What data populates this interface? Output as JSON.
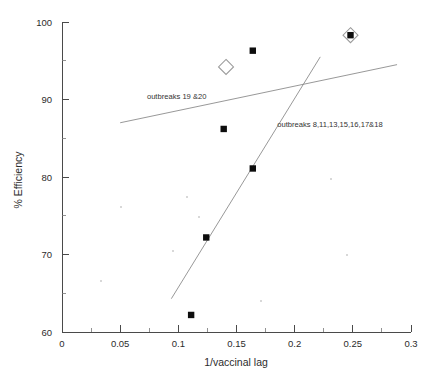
{
  "chart_data": {
    "type": "scatter",
    "title": "",
    "xlabel": "1/vaccinal lag",
    "ylabel": "% Efficiency",
    "xlim": [
      0,
      0.3
    ],
    "ylim": [
      60,
      100
    ],
    "grid": false,
    "legend_position": "inline-annotations",
    "x_ticks": [
      "0",
      "0.05",
      "0.1",
      "0.15",
      "0.2",
      "0.25",
      "0.3"
    ],
    "x_tick_values": [
      0,
      0.05,
      0.1,
      0.15,
      0.2,
      0.25,
      0.3
    ],
    "x_minor_tick_values": [
      0.025,
      0.075,
      0.125,
      0.175,
      0.225,
      0.275
    ],
    "y_ticks": [
      "60",
      "70",
      "80",
      "90",
      "100"
    ],
    "y_tick_values": [
      60,
      70,
      80,
      90,
      100
    ],
    "y_minor_tick_values": [
      65,
      75,
      85,
      95
    ],
    "series": [
      {
        "name": "data-points-filled-square",
        "marker": "filled-square",
        "points": [
          {
            "x": 0.111,
            "y": 62.2
          },
          {
            "x": 0.124,
            "y": 72.2
          },
          {
            "x": 0.139,
            "y": 86.2
          },
          {
            "x": 0.164,
            "y": 81.1
          },
          {
            "x": 0.164,
            "y": 96.3
          },
          {
            "x": 0.248,
            "y": 98.3
          }
        ]
      },
      {
        "name": "data-points-open-diamond",
        "marker": "open-diamond",
        "points": [
          {
            "x": 0.141,
            "y": 94.2
          },
          {
            "x": 0.248,
            "y": 98.3
          }
        ]
      }
    ],
    "trend_lines": [
      {
        "name": "outbreaks-19-20-fit",
        "label": "outbreaks  19 &20",
        "x1": 0.05,
        "y1": 87.0,
        "x2": 0.288,
        "y2": 94.5,
        "label_x": 0.073,
        "label_y": 90.1
      },
      {
        "name": "outbreaks-8-11-13-15-16-17-18-fit",
        "label": "outbreaks 8,11,13,15,16,17&18",
        "x1": 0.094,
        "y1": 64.3,
        "x2": 0.222,
        "y2": 95.5,
        "label_x": 0.185,
        "label_y": 86.4
      }
    ],
    "annotations": [
      {
        "name": "outbreaks-19-20-label",
        "text": "outbreaks  19 &20"
      },
      {
        "name": "outbreaks-8-18-label",
        "text": "outbreaks 8,11,13,15,16,17&18"
      }
    ],
    "colors": {
      "background": "#ffffff",
      "axis": "#4a4a4a",
      "marker_fill": "#0d0d0d",
      "diamond_stroke": "#9a9a9a",
      "trend_line": "#8c8c8c",
      "text": "#2b2b2b"
    }
  }
}
